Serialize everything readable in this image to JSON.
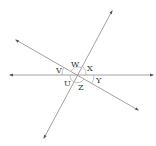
{
  "diagram": {
    "type": "intersecting-lines",
    "intersection": {
      "x": 78,
      "y": 75
    },
    "lines": [
      {
        "id": "horizontal",
        "from": {
          "x": 10,
          "y": 75
        },
        "to": {
          "x": 153,
          "y": 75
        }
      },
      {
        "id": "descending",
        "from": {
          "x": 16,
          "y": 40
        },
        "to": {
          "x": 138,
          "y": 110
        }
      },
      {
        "id": "ascending",
        "from": {
          "x": 112,
          "y": 11
        },
        "to": {
          "x": 44,
          "y": 138
        }
      }
    ],
    "angle_labels": [
      {
        "id": "v",
        "text": "V",
        "x": 56,
        "y": 73
      },
      {
        "id": "w",
        "text": "W",
        "x": 71,
        "y": 67
      },
      {
        "id": "x",
        "text": "X",
        "x": 87,
        "y": 71
      },
      {
        "id": "y",
        "text": "Y",
        "x": 96,
        "y": 83
      },
      {
        "id": "u",
        "text": "U",
        "x": 64,
        "y": 86
      },
      {
        "id": "z",
        "text": "Z",
        "x": 78,
        "y": 90
      }
    ]
  }
}
